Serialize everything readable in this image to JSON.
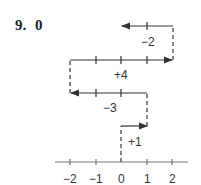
{
  "problem": {
    "number": "9.",
    "answer": "0"
  },
  "diagram": {
    "type": "number-line-moves",
    "steps": [
      {
        "label": "+1",
        "from": 0,
        "to": 1
      },
      {
        "label": "−3",
        "from": 1,
        "to": -2
      },
      {
        "label": "+4",
        "from": -2,
        "to": 2
      },
      {
        "label": "−2",
        "from": 2,
        "to": 0
      }
    ],
    "axis": {
      "ticks": [
        "−2",
        "−1",
        "0",
        "1",
        "2"
      ]
    }
  }
}
